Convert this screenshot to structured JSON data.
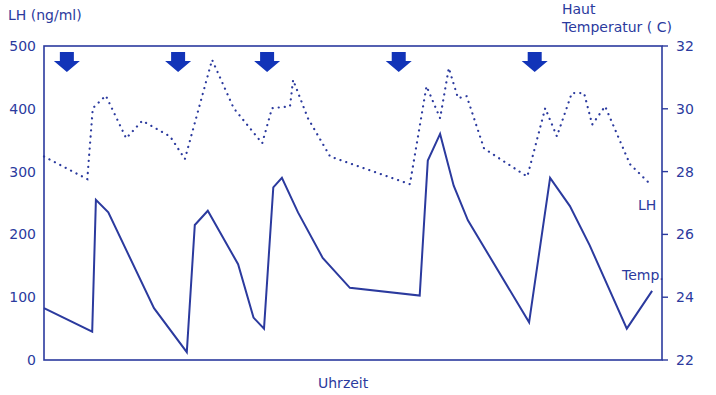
{
  "chart_data": {
    "type": "line",
    "title": "",
    "xlabel": "Uhrzeit",
    "ylabel": "LH (ng/ml)",
    "y2label_line1": "Haut",
    "y2label_line2": "Temperatur ( C)",
    "xlim": [
      0,
      100
    ],
    "ylim": [
      0,
      500
    ],
    "y2lim": [
      22,
      32
    ],
    "yticks": [
      "0",
      "100",
      "200",
      "300",
      "400",
      "500"
    ],
    "yticks_values": [
      0,
      100,
      200,
      300,
      400,
      500
    ],
    "y2ticks": [
      "22",
      "24",
      "26",
      "28",
      "30",
      "32"
    ],
    "y2ticks_values": [
      22,
      24,
      26,
      28,
      30,
      32
    ],
    "grid": false,
    "color": "#2b3a9e",
    "arrow_color": "#1234b8",
    "arrows_x": [
      3.7,
      21.7,
      36.1,
      57.4,
      79.4
    ],
    "series": [
      {
        "name": "LH",
        "label": "LH",
        "axis": "left",
        "style": "dotted",
        "x": [
          0,
          7.0,
          7.9,
          10.0,
          13.3,
          15.9,
          20.4,
          22.8,
          27.2,
          30.7,
          35.3,
          36.9,
          39.8,
          40.3,
          42.7,
          46.3,
          59.2,
          61.9,
          64.1,
          65.5,
          66.99,
          68.4,
          71.2,
          78.2,
          81.1,
          83.0,
          85.4,
          87.4,
          88.7,
          90.8,
          94.8,
          98.1
        ],
        "values": [
          324,
          288,
          401,
          421,
          353,
          381,
          356,
          320,
          478,
          401,
          345,
          401,
          404,
          446,
          385,
          324,
          280,
          436,
          385,
          465,
          417,
          420,
          337,
          292,
          401,
          356,
          425,
          425,
          375,
          404,
          312,
          280
        ]
      },
      {
        "name": "Temp.",
        "label": "Temp.",
        "axis": "right",
        "style": "solid",
        "x": [
          0,
          7.8,
          8.4,
          10.4,
          17.8,
          23.1,
          24.4,
          26.5,
          31.4,
          33.9,
          35.6,
          37.1,
          38.5,
          41.1,
          45.1,
          49.5,
          60.8,
          62.1,
          64.1,
          66.3,
          68.6,
          78.5,
          81.9,
          85.1,
          88.3,
          94.3,
          98.4
        ],
        "values": [
          23.65,
          22.9,
          27.1,
          26.7,
          23.65,
          22.25,
          26.3,
          26.75,
          25.05,
          23.35,
          23.0,
          27.5,
          27.8,
          26.7,
          25.25,
          24.3,
          24.05,
          28.35,
          29.2,
          27.55,
          26.45,
          23.2,
          27.8,
          26.9,
          25.65,
          23.0,
          24.2
        ]
      }
    ]
  }
}
